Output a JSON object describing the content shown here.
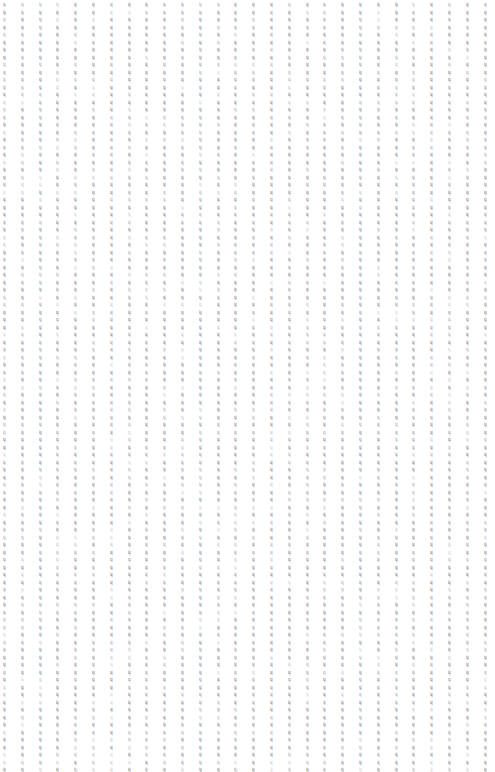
{
  "canvas": {
    "width": 495,
    "height": 772,
    "background_color": "#ffffff"
  },
  "pattern": {
    "description": "Uniform tiled grid of very small gray glyph marks covering the entire canvas",
    "glyph": "ɥ",
    "glyph_semantic_name": "tiny-glyph-mark",
    "glyph_color": "#8a8a92",
    "columns": 28,
    "rows": 103,
    "column_pitch_px": 17.8,
    "row_pitch_px": 7.5,
    "origin_x_px": 3,
    "origin_y_px": 0,
    "font_size_px": 6,
    "opacity_levels": [
      0.85,
      0.7,
      0.55,
      0.4,
      0.3
    ]
  }
}
